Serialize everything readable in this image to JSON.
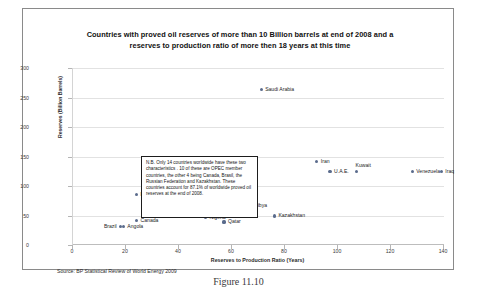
{
  "figure": {
    "caption": "Figure 11.10",
    "source_note": "Source: BP Statistical Review of World Energy 2009"
  },
  "annotation": {
    "text": "N.B. Only 14 countries worldwide have these two characteristics . 10 of these  are OPEC member countries, the other 4 being Canada, Brasil, the Russian Federation and Kazakhstan. These countries account for 87.1% of worldwide proved oil reserves at the end of 2008."
  },
  "chart_data": {
    "type": "scatter",
    "title_lines": [
      "Countries with proved oil reserves of more than 10 Billion barrels at end of 2008 and a",
      "reserves to production ratio of more then 18 years at this time"
    ],
    "title": "Countries with proved oil reserves of more than 10 Billion barrels at end of 2008 and a reserves to production ratio of more then 18 years at this time",
    "xlabel": "Reserves to Production Ratio (Years)",
    "ylabel": "Reserves (Billion Barrels)",
    "xlim": [
      0,
      140
    ],
    "ylim": [
      0,
      300
    ],
    "xticks": [
      0,
      20,
      40,
      60,
      80,
      100,
      120,
      140
    ],
    "yticks": [
      0,
      50,
      100,
      150,
      200,
      250,
      300
    ],
    "grid": "horizontal",
    "legend": "none",
    "marker_color": "#5a6b8c",
    "points": [
      {
        "label": "Saudi Arabia",
        "x": 71,
        "y": 264,
        "label_pos": "right"
      },
      {
        "label": "Iran",
        "x": 92,
        "y": 141,
        "label_pos": "right"
      },
      {
        "label": "Iraq",
        "x": 139,
        "y": 125,
        "label_pos": "right"
      },
      {
        "label": "U.A.E.",
        "x": 97,
        "y": 124,
        "label_pos": "right"
      },
      {
        "label": "Kuwait",
        "x": 107,
        "y": 124,
        "label_pos": "above"
      },
      {
        "label": "Venezuela",
        "x": 128,
        "y": 124,
        "label_pos": "right"
      },
      {
        "label": "Russian Federation",
        "x": 24,
        "y": 85,
        "label_pos": "right"
      },
      {
        "label": "Libya",
        "x": 69,
        "y": 56,
        "label_pos": "above"
      },
      {
        "label": "Kazakhstan",
        "x": 76,
        "y": 49,
        "label_pos": "right"
      },
      {
        "label": "Nigeria",
        "x": 50,
        "y": 47,
        "label_pos": "right"
      },
      {
        "label": "Canada",
        "x": 24,
        "y": 41,
        "label_pos": "right"
      },
      {
        "label": "Qatar",
        "x": 57,
        "y": 39,
        "label_pos": "right"
      },
      {
        "label": "Angola",
        "x": 19,
        "y": 31,
        "label_pos": "right"
      },
      {
        "label": "Brazil",
        "x": 18,
        "y": 31,
        "label_pos": "left"
      }
    ]
  }
}
